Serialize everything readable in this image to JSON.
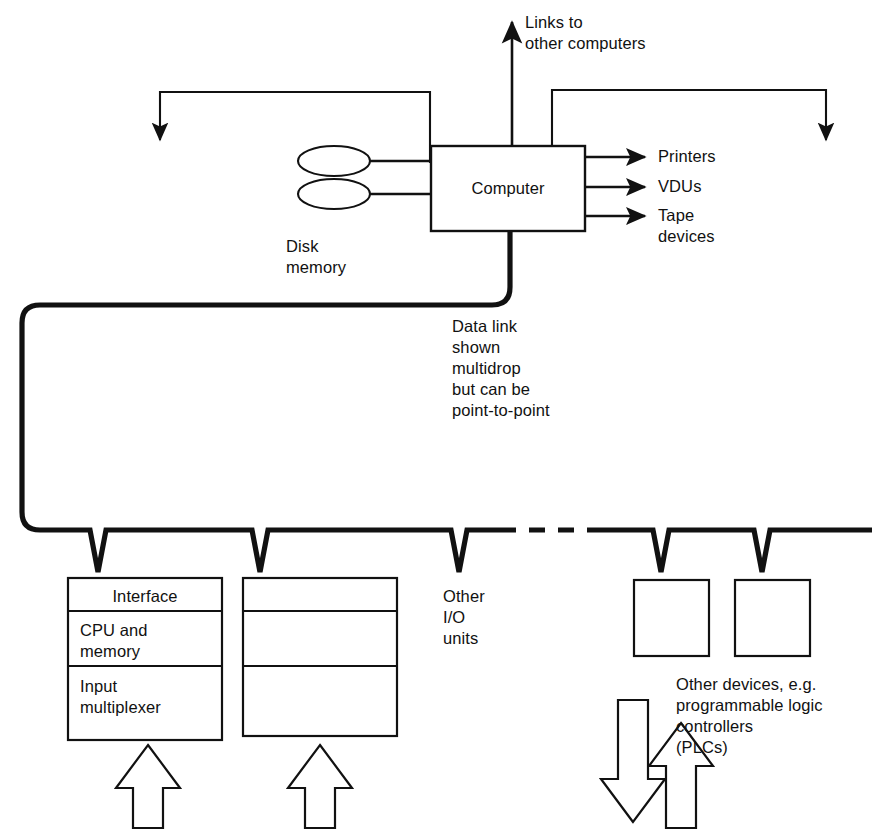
{
  "diagram": {
    "colors": {
      "ink": "#111111",
      "background": "#ffffff"
    },
    "nodes": {
      "computer": {
        "label": "Computer"
      },
      "disk_memory": {
        "label": "Disk\nmemory",
        "line1": "Disk",
        "line2": "memory"
      },
      "unit1": {
        "rows": [
          {
            "label": "Interface"
          },
          {
            "label": "CPU and\nmemory"
          },
          {
            "label": "Input\nmultiplexer"
          }
        ]
      },
      "unit2": {
        "rows": [
          {
            "label": ""
          },
          {
            "label": ""
          },
          {
            "label": ""
          }
        ]
      },
      "device_box_a": {
        "label": ""
      },
      "device_box_b": {
        "label": ""
      }
    },
    "labels": {
      "links_to_other_computers": "Links to\nother computers",
      "printers": "Printers",
      "vdus": "VDUs",
      "tape_devices": "Tape\ndevices",
      "data_link_note": "Data link\nshown\nmultidrop\nbut can be\npoint-to-point",
      "other_io_units": "Other\nI/O\nunits",
      "other_devices_note": "Other devices, e.g.\nprogrammable logic\ncontrollers\n(PLCs)"
    },
    "connectors": {
      "uplink_arrow": "links-up-arrow",
      "left_feedback_loop": "loop-arrow-down-left",
      "right_feedback_loop": "loop-arrow-down-right",
      "bus": "multidrop-data-link-bus",
      "bus_dashed_segment": "bus-continues-dashed",
      "drop_taps": 5,
      "input_arrows": 2,
      "device_arrows": 2
    }
  }
}
